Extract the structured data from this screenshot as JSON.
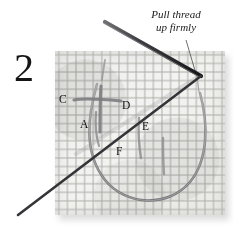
{
  "figure": {
    "kind": "instructional-illustration",
    "background_color": "#ffffff"
  },
  "step": {
    "number": "2"
  },
  "annotation": {
    "line1": "Pull thread",
    "line2": "up firmly",
    "style": "italic-serif",
    "leader": "thin line from text down-left to fabric"
  },
  "fabric": {
    "name": "aida-cloth",
    "weave_color": "#b0b0ac",
    "cloth_color": "#f4f4f2",
    "shadow_color": "#c9c9c9"
  },
  "needle": {
    "name": "sewing-needle",
    "color": "#3a3a3c",
    "eye_end": "upper-left",
    "point_end": "lower-left"
  },
  "thread": {
    "name": "embroidery-thread",
    "color": "#8d8d8f",
    "loop": "large oval loop below stitch"
  },
  "point_labels": [
    {
      "id": "C",
      "label": "C"
    },
    {
      "id": "A",
      "label": "A"
    },
    {
      "id": "D",
      "label": "D"
    },
    {
      "id": "E",
      "label": "E"
    },
    {
      "id": "F",
      "label": "F"
    }
  ]
}
